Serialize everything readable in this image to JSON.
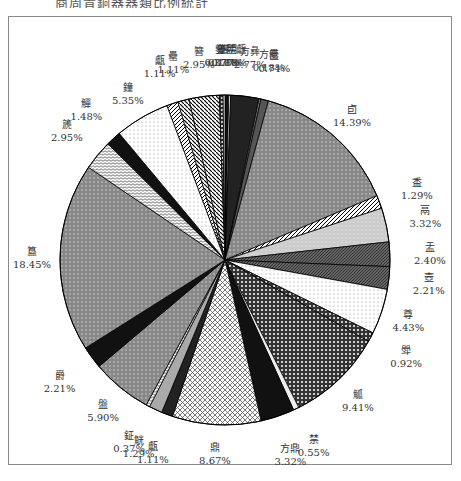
{
  "caption": "商周青銅器器類比例統計",
  "chart_data": {
    "type": "pie",
    "title": "",
    "start_angle_deg": 0,
    "direction": "clockwise",
    "slices": [
      {
        "label": "不明",
        "value": 0.37,
        "pct": "0.37%"
      },
      {
        "label": "分體甗",
        "value": 0.18,
        "pct": "0.18%"
      },
      {
        "label": "方彝",
        "value": 2.77,
        "pct": "2.77%"
      },
      {
        "label": "方罍",
        "value": 0.18,
        "pct": "0.18%"
      },
      {
        "label": "匜",
        "value": 0.74,
        "pct": "0.74%"
      },
      {
        "label": "卣",
        "value": 14.39,
        "pct": "14.39%"
      },
      {
        "label": "盉",
        "value": 1.29,
        "pct": "1.29%"
      },
      {
        "label": "鬲",
        "value": 3.32,
        "pct": "3.32%"
      },
      {
        "label": "盂",
        "value": 2.4,
        "pct": "2.40%"
      },
      {
        "label": "壺",
        "value": 2.21,
        "pct": "2.21%"
      },
      {
        "label": "尊",
        "value": 4.43,
        "pct": "4.43%"
      },
      {
        "label": "斝",
        "value": 0.92,
        "pct": "0.92%"
      },
      {
        "label": "觚",
        "value": 9.41,
        "pct": "9.41%"
      },
      {
        "label": "禁",
        "value": 0.55,
        "pct": "0.55%"
      },
      {
        "label": "方鼎",
        "value": 3.32,
        "pct": "3.32%"
      },
      {
        "label": "鼎",
        "value": 8.67,
        "pct": "8.67%"
      },
      {
        "label": "甗",
        "value": 1.11,
        "pct": "1.11%"
      },
      {
        "label": "觥",
        "value": 1.29,
        "pct": "1.29%"
      },
      {
        "label": "鉦",
        "value": 0.37,
        "pct": "0.37%"
      },
      {
        "label": "盤",
        "value": 5.9,
        "pct": "5.90%"
      },
      {
        "label": "爵",
        "value": 2.21,
        "pct": "2.21%"
      },
      {
        "label": "簋",
        "value": 18.45,
        "pct": "18.45%"
      },
      {
        "label": "篪",
        "value": 2.95,
        "pct": "2.95%"
      },
      {
        "label": "觶",
        "value": 1.48,
        "pct": "1.48%"
      },
      {
        "label": "鐘",
        "value": 5.35,
        "pct": "5.35%"
      },
      {
        "label": "甗",
        "value": 1.11,
        "pct": "1.11%"
      },
      {
        "label": "罍",
        "value": 1.11,
        "pct": "1.11%"
      },
      {
        "label": "簪",
        "value": 2.95,
        "pct": "2.95%"
      },
      {
        "label": "鎣",
        "value": 0.37,
        "pct": "0.37%"
      },
      {
        "label": "罐",
        "value": 0.18,
        "pct": "0.18%"
      }
    ],
    "legend": "none",
    "data_labels": "category and percentage with leader lines"
  }
}
